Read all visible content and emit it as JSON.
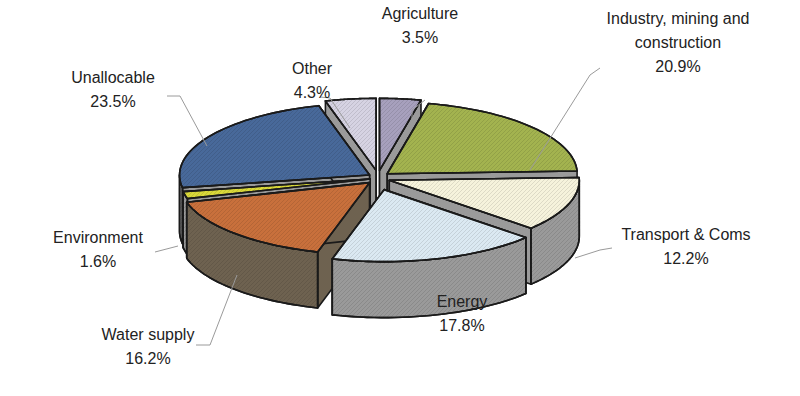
{
  "chart_data": {
    "type": "pie",
    "style": "3d-exploded",
    "title": "",
    "slices": [
      {
        "label": "Agriculture",
        "value": 3.5,
        "value_label": "3.5%",
        "color": "#a7a0bd"
      },
      {
        "label": "Industry, mining and construction",
        "value": 20.9,
        "value_label": "20.9%",
        "color": "#a3b34f"
      },
      {
        "label": "Transport & Coms",
        "value": 12.2,
        "value_label": "12.2%",
        "color": "#f6f3dc"
      },
      {
        "label": "Energy",
        "value": 17.8,
        "value_label": "17.8%",
        "color": "#dbe9f2"
      },
      {
        "label": "Water supply",
        "value": 16.2,
        "value_label": "16.2%",
        "color": "#c8703c"
      },
      {
        "label": "Environment",
        "value": 1.6,
        "value_label": "1.6%",
        "color": "#d9d83a"
      },
      {
        "label": "Unallocable",
        "value": 23.5,
        "value_label": "23.5%",
        "color": "#48699a"
      },
      {
        "label": "Other",
        "value": 4.3,
        "value_label": "4.3%",
        "color": "#d6d3e3"
      }
    ],
    "side_colors": {
      "default": "#9a9a9a",
      "water_supply": "#6e6250"
    },
    "label_lines": [
      [
        "Agriculture",
        "3.5%"
      ],
      [
        "Industry, mining and",
        "construction",
        "20.9%"
      ],
      [
        "Transport & Coms",
        "12.2%"
      ],
      [
        "Energy",
        "17.8%"
      ],
      [
        "Water supply",
        "16.2%"
      ],
      [
        "Environment",
        "1.6%"
      ],
      [
        "Unallocable",
        "23.5%"
      ],
      [
        "Other",
        "4.3%"
      ]
    ],
    "legend": "none (labels on slices)"
  }
}
